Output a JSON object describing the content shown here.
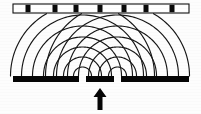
{
  "figure": {
    "canvas": {
      "width": 201,
      "height": 114
    },
    "background_color": "#fdfdfd",
    "ink_color": "#111111"
  },
  "detection_screen": {
    "label": "detection screen",
    "x": 13,
    "y": 4,
    "width": 176,
    "height": 9,
    "fill_color": "#ffffff",
    "stroke_color": "#111111",
    "fringe_label": "interference maximum",
    "fringe_color": "#0a0a0a",
    "fringe_width": 5,
    "fringe_centers": [
      28,
      55,
      76,
      100,
      124,
      146,
      172
    ]
  },
  "barrier": {
    "label": "slit barrier",
    "y": 76,
    "height": 6,
    "fill_color": "#050505",
    "segments": [
      {
        "name": "barrier-left",
        "x": 13,
        "width": 66
      },
      {
        "name": "barrier-middle",
        "x": 86,
        "width": 28
      },
      {
        "name": "barrier-right",
        "x": 121,
        "width": 68
      }
    ],
    "slits": [
      {
        "name": "slit-left",
        "x": 82.5
      },
      {
        "name": "slit-right",
        "x": 117.5
      }
    ]
  },
  "waves": {
    "label": "circular wavefronts",
    "stroke_color": "#161616",
    "stroke_width": 1.15,
    "origin_y": 76,
    "sources": [
      {
        "name": "wave-source-left",
        "cx": 82.5
      },
      {
        "name": "wave-source-right",
        "cx": 117.5
      }
    ],
    "radii": [
      9,
      19,
      29,
      39,
      50,
      61,
      72
    ]
  },
  "incident_arrow": {
    "label": "incident plane wave",
    "cx": 100,
    "tip_y": 88,
    "tail_y": 110,
    "shaft_width": 5,
    "head_width": 13,
    "head_height": 9,
    "color": "#060606"
  }
}
